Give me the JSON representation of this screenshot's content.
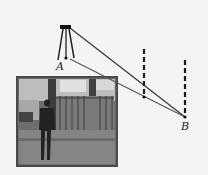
{
  "figure": {
    "type": "surveying diagram",
    "labels": {
      "point_a": "A",
      "point_b": "B"
    },
    "instrument": {
      "name": "tripod-theodolite",
      "head": [
        65,
        28
      ],
      "base_point": [
        69,
        59
      ]
    },
    "poles": [
      {
        "name": "middle-pole",
        "x": 144,
        "top": 49,
        "bottom": 98
      },
      {
        "name": "right-pole",
        "x": 185,
        "top": 60,
        "bottom": 118
      }
    ],
    "sight_lines": [
      {
        "name": "upper-sight-line",
        "from": [
          70,
          28
        ],
        "to": [
          185,
          117
        ]
      },
      {
        "name": "lower-sight-line",
        "from": [
          70,
          59
        ],
        "to": [
          185,
          117
        ]
      }
    ],
    "photo": {
      "description": "photo of person standing in front of trees and fence",
      "x": 17,
      "y": 77,
      "width": 100,
      "height": 89
    },
    "colors": {
      "line": "#3a3a3a",
      "pole": "#1a1a1a",
      "photo_frame": "#5a5a5a",
      "background": "#f4f4f4"
    }
  }
}
